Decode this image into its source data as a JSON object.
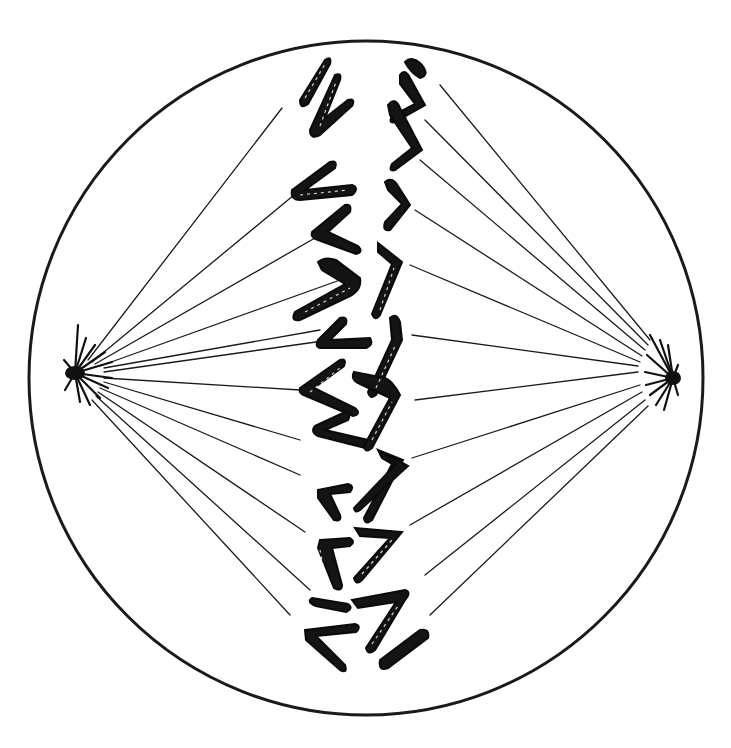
{
  "figure": {
    "subject": "Cell in metaphase of mitosis",
    "colors": {
      "ink": "#141414",
      "background": "#ffffff"
    }
  },
  "cell": {
    "cx": 366,
    "cy": 378,
    "rx": 337,
    "ry": 337
  },
  "poles": [
    {
      "name": "left-centrosome",
      "x": 75,
      "y": 373
    },
    {
      "name": "right-centrosome",
      "x": 668,
      "y": 378
    }
  ],
  "metaphase_plate": {
    "x_range": [
      295,
      430
    ],
    "y_range": [
      50,
      670
    ]
  }
}
